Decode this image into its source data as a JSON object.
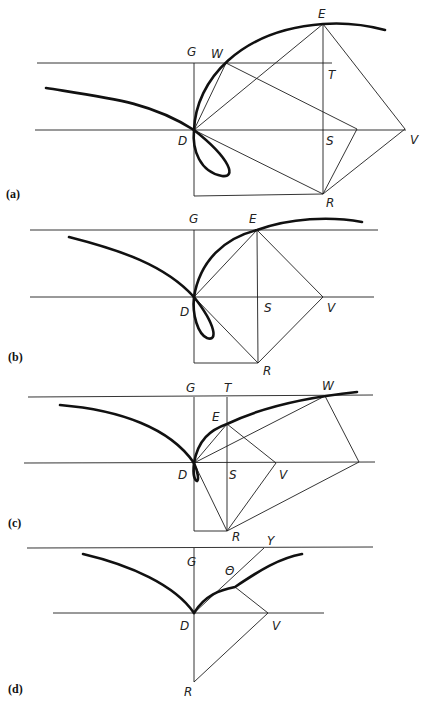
{
  "figure": {
    "panels": [
      {
        "id": "a",
        "caption": "(a)",
        "points": {
          "G": "G",
          "W": "W",
          "E": "E",
          "T": "T",
          "D": "D",
          "S": "S",
          "V": "V",
          "R": "R"
        }
      },
      {
        "id": "b",
        "caption": "(b)",
        "points": {
          "G": "G",
          "E": "E",
          "D": "D",
          "S": "S",
          "V": "V",
          "R": "R"
        }
      },
      {
        "id": "c",
        "caption": "(c)",
        "points": {
          "G": "G",
          "T": "T",
          "W": "W",
          "E": "E",
          "D": "D",
          "S": "S",
          "V": "V",
          "R": "R"
        }
      },
      {
        "id": "d",
        "caption": "(d)",
        "points": {
          "G": "G",
          "Y": "Y",
          "Theta": "Θ",
          "D": "D",
          "V": "V",
          "R": "R"
        }
      }
    ],
    "colors": {
      "ink": "#111111",
      "background": "#ffffff"
    }
  }
}
